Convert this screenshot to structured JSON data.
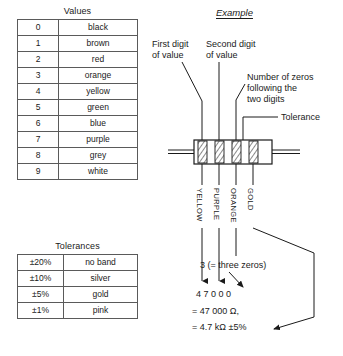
{
  "figure": {
    "title_example": "Example"
  },
  "values_table": {
    "title": "Values",
    "columns": [
      "digit",
      "colour"
    ],
    "rows": [
      {
        "digit": "0",
        "colour": "black"
      },
      {
        "digit": "1",
        "colour": "brown"
      },
      {
        "digit": "2",
        "colour": "red"
      },
      {
        "digit": "3",
        "colour": "orange"
      },
      {
        "digit": "4",
        "colour": "yellow"
      },
      {
        "digit": "5",
        "colour": "green"
      },
      {
        "digit": "6",
        "colour": "blue"
      },
      {
        "digit": "7",
        "colour": "purple"
      },
      {
        "digit": "8",
        "colour": "grey"
      },
      {
        "digit": "9",
        "colour": "white"
      }
    ]
  },
  "tolerances_table": {
    "title": "Tolerances",
    "columns": [
      "tolerance",
      "colour"
    ],
    "rows": [
      {
        "tolerance": "±20%",
        "colour": "no band"
      },
      {
        "tolerance": "±10%",
        "colour": "silver"
      },
      {
        "tolerance": "±5%",
        "colour": "gold"
      },
      {
        "tolerance": "±1%",
        "colour": "pink"
      }
    ]
  },
  "annotations": {
    "first_digit": "First digit\nof value",
    "second_digit": "Second digit\nof value",
    "number_of_zeros": "Number of zeros\nfollowing the\ntwo digits",
    "tolerance": "Tolerance"
  },
  "resistor": {
    "band_labels": [
      "YELLOW",
      "PURPLE",
      "ORANGE",
      "GOLD"
    ],
    "band_count": 4
  },
  "calculation": {
    "zeros_note": "3 (= three zeros)",
    "digits_line": "4  7    0 0 0",
    "ohms_line": "= 47 000 Ω,",
    "kohms_line": "= 4.7 kΩ ±5%"
  },
  "colors": {
    "ink": "#1a1a1a",
    "rule": "#5a5a5a",
    "paper": "#ffffff"
  }
}
